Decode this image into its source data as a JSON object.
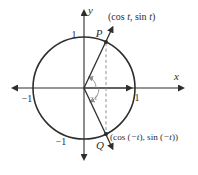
{
  "palette": {
    "ink": "#2e2e2e",
    "muted": "#8f8f8f",
    "bg": "#ffffff"
  },
  "figure": {
    "type": "unit-circle-diagram",
    "description_visible_text_only": true
  },
  "axes": {
    "x_label": "x",
    "y_label": "y"
  },
  "ticks": {
    "x_pos": "1",
    "x_neg": "−1",
    "y_pos": "1",
    "y_neg": "−1"
  },
  "points": {
    "p_label": "P",
    "q_label": "Q"
  },
  "angle_labels": {
    "pos": "t",
    "neg": "−t"
  },
  "coords_p": {
    "parts": [
      "(cos ",
      "t",
      ", sin ",
      "t",
      ")"
    ]
  },
  "coords_q": {
    "parts": [
      "(cos (",
      "−t",
      "), sin (",
      "−t",
      "))"
    ]
  }
}
